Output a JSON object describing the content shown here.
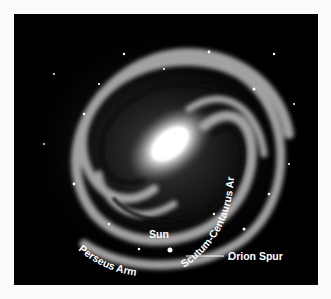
{
  "image": {
    "subject": "Milky Way galaxy spiral illustration",
    "background_color": "#000000",
    "labels": {
      "scutum_centaurus_arm": "Scutum-Centaurus Arm",
      "sun": "Sun",
      "orion_spur": "Orion Spur",
      "perseus_arm": "Perseus Arm"
    }
  }
}
